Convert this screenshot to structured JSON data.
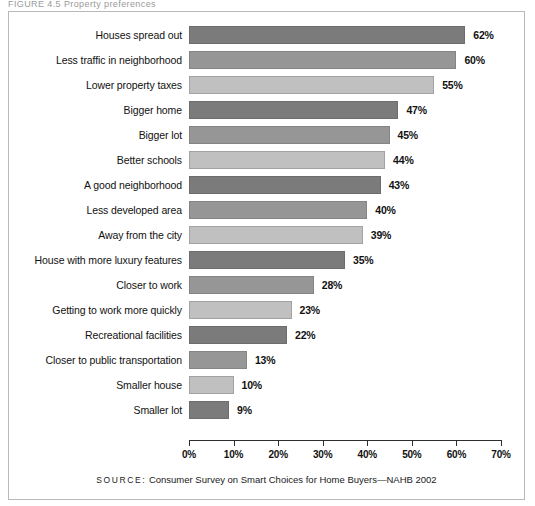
{
  "figure": {
    "caption_sliver": "FIGURE 4.5   Property preferences",
    "source_prefix": "SOURCE:",
    "source_text": "Consumer Survey on Smart Choices for Home Buyers—NAHB 2002"
  },
  "colors": {
    "tone_dark": "#7b7b7b",
    "tone_mid": "#969696",
    "tone_light": "#c0c0c0",
    "frame_border": "#b9b9b9",
    "axis": "#2e2e2e",
    "text": "#111111"
  },
  "chart_data": {
    "type": "bar",
    "orientation": "horizontal",
    "title": "",
    "subtitle": "",
    "xlabel": "",
    "ylabel": "",
    "xlim": [
      0,
      70
    ],
    "grid": false,
    "legend": "none",
    "value_suffix": "%",
    "tick_labels": [
      "0%",
      "10%",
      "20%",
      "30%",
      "40%",
      "50%",
      "60%",
      "70%"
    ],
    "tick_values": [
      0,
      10,
      20,
      30,
      40,
      50,
      60,
      70
    ],
    "categories": [
      "Houses spread out",
      "Less traffic in neighborhood",
      "Lower property taxes",
      "Bigger home",
      "Bigger lot",
      "Better schools",
      "A good neighborhood",
      "Less developed area",
      "Away from the city",
      "House with more luxury features",
      "Closer to work",
      "Getting to work more quickly",
      "Recreational facilities",
      "Closer to public transportation",
      "Smaller house",
      "Smaller lot"
    ],
    "values": [
      62,
      60,
      55,
      47,
      45,
      44,
      43,
      40,
      39,
      35,
      28,
      23,
      22,
      13,
      10,
      9
    ],
    "value_labels": [
      "62%",
      "60%",
      "55%",
      "47%",
      "45%",
      "44%",
      "43%",
      "40%",
      "39%",
      "35%",
      "28%",
      "23%",
      "22%",
      "13%",
      "10%",
      "9%"
    ],
    "bar_tones": [
      "dark",
      "mid",
      "light",
      "dark",
      "mid",
      "light",
      "dark",
      "mid",
      "light",
      "dark",
      "mid",
      "light",
      "dark",
      "mid",
      "light",
      "dark"
    ]
  }
}
